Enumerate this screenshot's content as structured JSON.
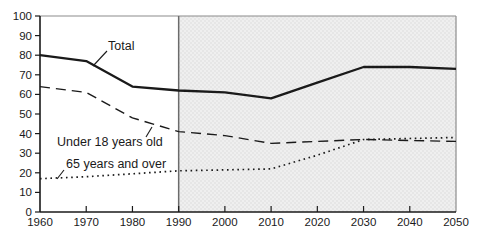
{
  "figure": {
    "width": 482,
    "height": 243,
    "background": "#ffffff"
  },
  "chart_data": {
    "type": "line",
    "title": "",
    "xlabel": "",
    "ylabel": "",
    "xlim": [
      1960,
      2050
    ],
    "ylim": [
      0,
      100
    ],
    "grid": false,
    "x": [
      1960,
      1970,
      1980,
      1990,
      2000,
      2010,
      2020,
      2030,
      2040,
      2050
    ],
    "x_tick_labels": [
      "1960",
      "1970",
      "1980",
      "1990",
      "2000",
      "2010",
      "2020",
      "2030",
      "2040",
      "2050"
    ],
    "y_ticks": [
      0,
      10,
      20,
      30,
      40,
      50,
      60,
      70,
      80,
      90,
      100
    ],
    "y_tick_labels": [
      "0",
      "10",
      "20",
      "30",
      "40",
      "50",
      "60",
      "70",
      "80",
      "90",
      "100"
    ],
    "series": [
      {
        "name": "Under 18 years old",
        "line_style": "dashed",
        "values": [
          64,
          61,
          48,
          41,
          39,
          35,
          36,
          37,
          36.5,
          36
        ]
      },
      {
        "name": "65 years and over",
        "line_style": "dotted",
        "values": [
          17,
          18,
          19.5,
          21,
          21.5,
          22,
          29,
          37,
          37.5,
          38
        ]
      },
      {
        "name": "Total",
        "line_style": "solid",
        "values": [
          80,
          77,
          64,
          62,
          61,
          58,
          66,
          74,
          74,
          73
        ]
      }
    ],
    "projection_region": {
      "from_x": 1990,
      "to_x": 2050,
      "note": "shaded stippled area"
    },
    "annotations": [
      {
        "text": "Total",
        "px": 108,
        "py": 50,
        "leader": [
          107,
          51,
          93,
          66
        ]
      },
      {
        "text": "Under 18 years old",
        "px": 57,
        "py": 146,
        "leader": [
          146,
          137,
          152,
          127
        ]
      },
      {
        "text": "65 years and over",
        "px": 66,
        "py": 168,
        "leader": [
          64,
          170,
          57,
          179
        ]
      }
    ],
    "colors": {
      "line": "#1a1a1a",
      "axis": "#1a1a1a",
      "shade_base": "#efefef",
      "shade_dot": "#d6d6d6",
      "divider": "#6b6b6b",
      "border": "#8c8c8c"
    },
    "legend_position": "none (direct line labels)"
  }
}
